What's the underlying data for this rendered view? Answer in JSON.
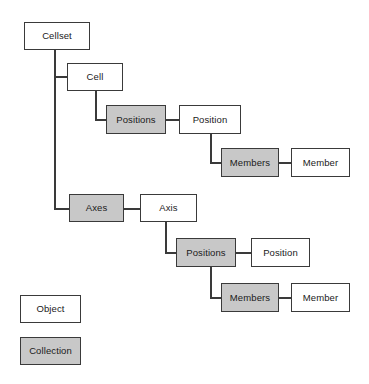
{
  "diagram": {
    "colors": {
      "object_fill": "#ffffff",
      "collection_fill": "#c8c8c8",
      "stroke": "#3a3a3a",
      "background": "#ffffff",
      "text": "#1a1a1a"
    },
    "nodes": [
      {
        "id": "cellset",
        "label": "Cellset",
        "kind": "object",
        "x": 24,
        "y": 22,
        "w": 66,
        "h": 28
      },
      {
        "id": "cell",
        "label": "Cell",
        "kind": "object",
        "x": 67,
        "y": 63,
        "w": 56,
        "h": 28
      },
      {
        "id": "positions1",
        "label": "Positions",
        "kind": "collection",
        "x": 106,
        "y": 105,
        "w": 60,
        "h": 29
      },
      {
        "id": "position1",
        "label": "Position",
        "kind": "object",
        "x": 179,
        "y": 105,
        "w": 62,
        "h": 29
      },
      {
        "id": "members1",
        "label": "Members",
        "kind": "collection",
        "x": 221,
        "y": 148,
        "w": 58,
        "h": 29
      },
      {
        "id": "member1",
        "label": "Member",
        "kind": "object",
        "x": 291,
        "y": 148,
        "w": 59,
        "h": 29
      },
      {
        "id": "axes",
        "label": "Axes",
        "kind": "collection",
        "x": 69,
        "y": 194,
        "w": 55,
        "h": 28
      },
      {
        "id": "axis",
        "label": "Axis",
        "kind": "object",
        "x": 140,
        "y": 194,
        "w": 57,
        "h": 28
      },
      {
        "id": "positions2",
        "label": "Positions",
        "kind": "collection",
        "x": 176,
        "y": 238,
        "w": 60,
        "h": 29
      },
      {
        "id": "position2",
        "label": "Position",
        "kind": "object",
        "x": 251,
        "y": 238,
        "w": 59,
        "h": 29
      },
      {
        "id": "members2",
        "label": "Members",
        "kind": "collection",
        "x": 221,
        "y": 283,
        "w": 58,
        "h": 29
      },
      {
        "id": "member2",
        "label": "Member",
        "kind": "object",
        "x": 291,
        "y": 283,
        "w": 59,
        "h": 29
      }
    ],
    "edges": [
      {
        "id": "cellset-trunk",
        "from": "cellset",
        "to": "trunk",
        "orient": "v",
        "x": 54,
        "y": 50,
        "len": 159
      },
      {
        "id": "trunk-to-cell",
        "from": "trunk",
        "to": "cell",
        "orient": "h",
        "x": 54,
        "y": 76,
        "len": 14
      },
      {
        "id": "trunk-to-axes",
        "from": "trunk",
        "to": "axes",
        "orient": "h",
        "x": 54,
        "y": 208,
        "len": 16
      },
      {
        "id": "cell-drop",
        "from": "cell",
        "to": "positions1",
        "orient": "v",
        "x": 95,
        "y": 91,
        "len": 29
      },
      {
        "id": "cell-drop-to-pos",
        "from": "cell",
        "to": "positions1",
        "orient": "h",
        "x": 95,
        "y": 119,
        "len": 12
      },
      {
        "id": "pos1-to-position1",
        "from": "positions1",
        "to": "position1",
        "orient": "h",
        "x": 166,
        "y": 119,
        "len": 14
      },
      {
        "id": "position1-drop",
        "from": "position1",
        "to": "members1",
        "orient": "v",
        "x": 210,
        "y": 134,
        "len": 29
      },
      {
        "id": "position1-drop-to-mem",
        "from": "position1",
        "to": "members1",
        "orient": "h",
        "x": 210,
        "y": 162,
        "len": 12
      },
      {
        "id": "mem1-to-member1",
        "from": "members1",
        "to": "member1",
        "orient": "h",
        "x": 279,
        "y": 162,
        "len": 13
      },
      {
        "id": "axes-to-axis",
        "from": "axes",
        "to": "axis",
        "orient": "h",
        "x": 124,
        "y": 208,
        "len": 17
      },
      {
        "id": "axis-drop",
        "from": "axis",
        "to": "positions2",
        "orient": "v",
        "x": 165,
        "y": 222,
        "len": 31
      },
      {
        "id": "axis-drop-to-pos",
        "from": "axis",
        "to": "positions2",
        "orient": "h",
        "x": 165,
        "y": 252,
        "len": 12
      },
      {
        "id": "pos2-to-position2",
        "from": "positions2",
        "to": "position2",
        "orient": "h",
        "x": 236,
        "y": 252,
        "len": 16
      },
      {
        "id": "positions2-drop",
        "from": "positions2",
        "to": "members2",
        "orient": "v",
        "x": 210,
        "y": 267,
        "len": 31
      },
      {
        "id": "positions2-drop-to-mem",
        "from": "positions2",
        "to": "members2",
        "orient": "h",
        "x": 210,
        "y": 297,
        "len": 12
      },
      {
        "id": "mem2-to-member2",
        "from": "members2",
        "to": "member2",
        "orient": "h",
        "x": 279,
        "y": 297,
        "len": 13
      }
    ],
    "legend": {
      "items": [
        {
          "id": "legend-object",
          "label": "Object",
          "kind": "object",
          "x": 20,
          "y": 295,
          "w": 61,
          "h": 28
        },
        {
          "id": "legend-collection",
          "label": "Collection",
          "kind": "collection",
          "x": 20,
          "y": 337,
          "w": 61,
          "h": 28
        }
      ]
    }
  }
}
